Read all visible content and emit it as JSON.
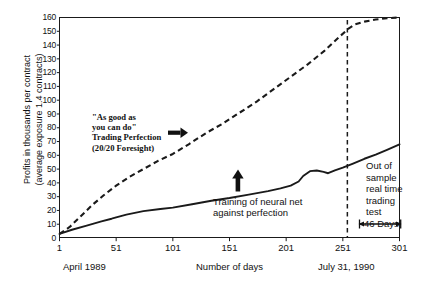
{
  "chart_data": {
    "type": "line",
    "title": "",
    "xlabel": "Number of days",
    "ylabel": "Profits in thousands per contract (average exposure 1.4 contracts)",
    "ylabel_line1": "Profits in thousands per contract",
    "ylabel_line2": "(average exposure 1.4 contracts)",
    "xlim": [
      1,
      301
    ],
    "ylim": [
      0,
      160
    ],
    "grid": false,
    "legend_position": "none",
    "yticks": [
      0,
      10,
      20,
      30,
      40,
      50,
      60,
      70,
      80,
      90,
      100,
      110,
      120,
      130,
      140,
      150,
      160
    ],
    "xticks": [
      1,
      51,
      101,
      151,
      201,
      251,
      301
    ],
    "series": [
      {
        "name": "Trading Perfection (20/20 Foresight)",
        "style": "dashed",
        "x": [
          1,
          10,
          20,
          30,
          40,
          51,
          62,
          75,
          88,
          101,
          115,
          130,
          145,
          160,
          175,
          190,
          205,
          220,
          235,
          248,
          256,
          262,
          270,
          280,
          290,
          301
        ],
        "y": [
          3,
          8,
          16,
          24,
          31,
          38,
          44,
          50,
          56,
          61,
          68,
          76,
          83,
          91,
          99,
          108,
          117,
          126,
          136,
          146,
          152,
          155,
          157,
          158.5,
          159.5,
          160
        ]
      },
      {
        "name": "Neural net trained against perfection",
        "style": "solid",
        "x": [
          1,
          12,
          25,
          38,
          47,
          51,
          60,
          75,
          90,
          101,
          118,
          135,
          151,
          168,
          185,
          196,
          205,
          212,
          216,
          222,
          228,
          234,
          238,
          244,
          251,
          260,
          270,
          280,
          290,
          301
        ],
        "y": [
          3,
          6,
          9,
          12,
          14,
          15,
          17,
          19.5,
          21,
          22,
          24.5,
          27,
          29,
          31.5,
          34,
          36,
          38,
          41,
          45,
          48.5,
          49,
          48,
          47,
          49,
          51,
          54,
          57.5,
          60.5,
          64,
          68
        ]
      }
    ],
    "annotations": [
      {
        "name": "trading-perfection-callout",
        "lines": [
          "\"As good as",
          "you can do\"",
          "Trading Perfection",
          "(20/20 Foresight)"
        ],
        "arrow": "right"
      },
      {
        "name": "training-callout",
        "lines": [
          "Training of neural net",
          "against perfection"
        ],
        "arrow": "up"
      },
      {
        "name": "out-of-sample-callout",
        "lines": [
          "Out of",
          "sample",
          "real time",
          "trading",
          "test"
        ],
        "arrow": "none"
      },
      {
        "name": "span-label",
        "text": "46 Days",
        "arrow": "double"
      }
    ],
    "markers": [
      {
        "name": "out-of-sample-divider",
        "type": "vline",
        "x": 255,
        "style": "dashed"
      }
    ]
  },
  "axis": {
    "x_caption_left": "April 1989",
    "x_caption_center": "Number of days",
    "x_caption_right": "July 31, 1990"
  },
  "colors": {
    "line": "#1a1a1a",
    "background": "#ffffff",
    "text": "#111111"
  }
}
